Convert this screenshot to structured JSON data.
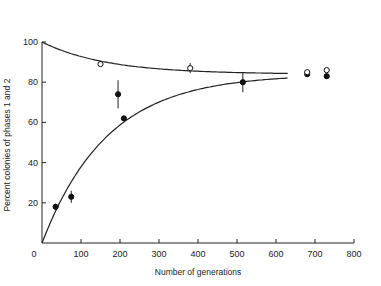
{
  "chart_data": {
    "type": "scatter",
    "title": "",
    "xlabel": "Number of generations",
    "ylabel": "Percent colonies of phases 1 and 2",
    "xlim": [
      0,
      800
    ],
    "ylim": [
      0,
      100
    ],
    "x_ticks": [
      0,
      100,
      200,
      300,
      400,
      500,
      600,
      700,
      800
    ],
    "y_ticks": [
      20,
      40,
      60,
      80,
      100
    ],
    "grid": false,
    "legend": null,
    "series": [
      {
        "name": "filled circles",
        "marker": "filled-circle",
        "points": [
          {
            "x": 35,
            "y": 18,
            "err": 1.5
          },
          {
            "x": 75,
            "y": 23,
            "err": 3
          },
          {
            "x": 195,
            "y": 74,
            "err": 7
          },
          {
            "x": 210,
            "y": 62,
            "err": 0
          },
          {
            "x": 515,
            "y": 80,
            "err": 5
          },
          {
            "x": 680,
            "y": 84,
            "err": 0
          },
          {
            "x": 730,
            "y": 83,
            "err": 0
          }
        ]
      },
      {
        "name": "open circles",
        "marker": "open-circle",
        "points": [
          {
            "x": 150,
            "y": 89,
            "err": 1
          },
          {
            "x": 380,
            "y": 87,
            "err": 2.5
          },
          {
            "x": 680,
            "y": 85,
            "err": 0
          },
          {
            "x": 730,
            "y": 86,
            "err": 0
          }
        ]
      }
    ],
    "curves": [
      {
        "name": "upper fitted curve",
        "from": [
          0,
          100
        ],
        "asymptote": 84,
        "rate": 0.006,
        "x_end": 630
      },
      {
        "name": "lower fitted curve",
        "from": [
          0,
          0
        ],
        "asymptote": 84,
        "rate": 0.006,
        "x_end": 630
      }
    ]
  },
  "labels": {
    "xlabel": "Number of generations",
    "ylabel": "Percent colonies of phases 1 and 2"
  }
}
